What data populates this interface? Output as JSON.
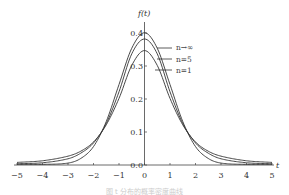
{
  "chart_data": {
    "type": "line",
    "title": "",
    "xlabel": "t",
    "ylabel": "f(t)",
    "xlim": [
      -5,
      5
    ],
    "ylim": [
      0,
      0.4
    ],
    "grid": false,
    "legend_position": "right of peak, inline labels",
    "x_ticks": [
      -5,
      -4,
      -3,
      -2,
      -1,
      0,
      1,
      2,
      3,
      4,
      5
    ],
    "x_tick_labels": [
      "−5",
      "−4",
      "−3",
      "−2",
      "−1",
      "0",
      "1",
      "2",
      "3",
      "4",
      "5"
    ],
    "y_ticks": [
      0.0,
      0.1,
      0.2,
      0.3,
      0.4
    ],
    "y_tick_labels": [
      "0.0",
      "0.1",
      "0.2",
      "0.3",
      "0.4"
    ],
    "x": [
      -5,
      -4,
      -3,
      -2.5,
      -2,
      -1.5,
      -1,
      -0.5,
      0,
      0.5,
      1,
      1.5,
      2,
      2.5,
      3,
      4,
      5
    ],
    "series": [
      {
        "name": "n→∞",
        "values": [
          0.0,
          0.0001,
          0.004,
          0.018,
          0.054,
          0.13,
          0.242,
          0.352,
          0.399,
          0.352,
          0.242,
          0.13,
          0.054,
          0.018,
          0.004,
          0.0001,
          0.0
        ]
      },
      {
        "name": "n=5",
        "values": [
          0.002,
          0.005,
          0.017,
          0.034,
          0.065,
          0.124,
          0.22,
          0.335,
          0.38,
          0.335,
          0.22,
          0.124,
          0.065,
          0.034,
          0.017,
          0.005,
          0.002
        ]
      },
      {
        "name": "n=1",
        "values": [
          0.006,
          0.011,
          0.025,
          0.04,
          0.068,
          0.12,
          0.2,
          0.3,
          0.345,
          0.3,
          0.2,
          0.12,
          0.068,
          0.04,
          0.025,
          0.011,
          0.006
        ]
      }
    ]
  },
  "labels": {
    "y_axis": "f(t)",
    "x_axis": "t",
    "legend": [
      "n→∞",
      "n=5",
      "n=1"
    ],
    "caption": "图  t 分布的概率密度曲线"
  },
  "colors": {
    "curve": "#333333",
    "axis": "#444444"
  }
}
